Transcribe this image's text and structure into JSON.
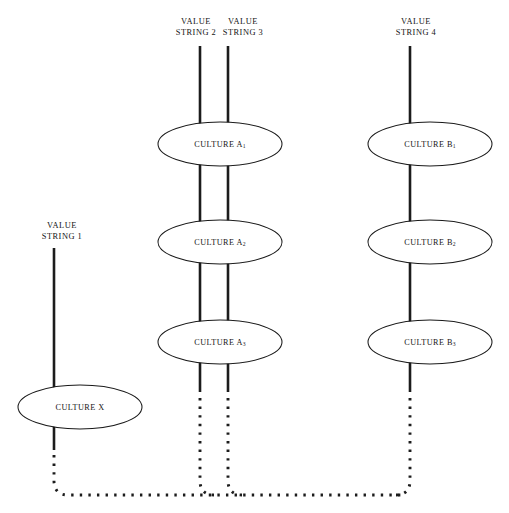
{
  "diagram": {
    "colors": {
      "background": "#ffffff",
      "stroke": "#1c1c1c",
      "ellipse_stroke": "#1a1a1a",
      "text": "#141414"
    },
    "value_strings": [
      {
        "id": "vs1",
        "line1": "VALUE",
        "line2": "STRING 1",
        "x": 62,
        "label_y": 228
      },
      {
        "id": "vs2",
        "line1": "VALUE",
        "line2": "STRING 2",
        "x": 196,
        "label_y": 24
      },
      {
        "id": "vs3",
        "line1": "VALUE",
        "line2": "STRING 3",
        "x": 243,
        "label_y": 24
      },
      {
        "id": "vs4",
        "line1": "VALUE",
        "line2": "STRING 4",
        "x": 416,
        "label_y": 24
      }
    ],
    "cultures": [
      {
        "id": "culture-a1",
        "name": "CULTURE A",
        "subscript": "1",
        "cx": 220,
        "cy": 144,
        "rx": 62,
        "ry": 22
      },
      {
        "id": "culture-a2",
        "name": "CULTURE A",
        "subscript": "2",
        "cx": 220,
        "cy": 242,
        "rx": 62,
        "ry": 22
      },
      {
        "id": "culture-a3",
        "name": "CULTURE A",
        "subscript": "3",
        "cx": 220,
        "cy": 342,
        "rx": 62,
        "ry": 22
      },
      {
        "id": "culture-b1",
        "name": "CULTURE B",
        "subscript": "1",
        "cx": 430,
        "cy": 144,
        "rx": 62,
        "ry": 22
      },
      {
        "id": "culture-b2",
        "name": "CULTURE B",
        "subscript": "2",
        "cx": 430,
        "cy": 242,
        "rx": 62,
        "ry": 22
      },
      {
        "id": "culture-b3",
        "name": "CULTURE B",
        "subscript": "3",
        "cx": 430,
        "cy": 342,
        "rx": 62,
        "ry": 22
      },
      {
        "id": "culture-x",
        "name": "CULTURE X",
        "subscript": "",
        "cx": 80,
        "cy": 407,
        "rx": 62,
        "ry": 22
      }
    ],
    "solid_segments": [
      {
        "id": "seg-vs2-top",
        "x1": 200,
        "y1": 46,
        "x2": 200,
        "y2": 128
      },
      {
        "id": "seg-vs3-top",
        "x1": 228,
        "y1": 46,
        "x2": 228,
        "y2": 128
      },
      {
        "id": "seg-vs2-a1a2",
        "x1": 200,
        "y1": 160,
        "x2": 200,
        "y2": 226
      },
      {
        "id": "seg-vs3-a1a2",
        "x1": 228,
        "y1": 160,
        "x2": 228,
        "y2": 226
      },
      {
        "id": "seg-vs2-a2a3",
        "x1": 200,
        "y1": 258,
        "x2": 200,
        "y2": 326
      },
      {
        "id": "seg-vs3-a2a3",
        "x1": 228,
        "y1": 258,
        "x2": 228,
        "y2": 326
      },
      {
        "id": "seg-vs2-a3out",
        "x1": 200,
        "y1": 358,
        "x2": 200,
        "y2": 392
      },
      {
        "id": "seg-vs3-a3out",
        "x1": 228,
        "y1": 358,
        "x2": 228,
        "y2": 392
      },
      {
        "id": "seg-vs4-top",
        "x1": 410,
        "y1": 46,
        "x2": 410,
        "y2": 128
      },
      {
        "id": "seg-vs4-b1b2",
        "x1": 410,
        "y1": 160,
        "x2": 410,
        "y2": 226
      },
      {
        "id": "seg-vs4-b2b3",
        "x1": 410,
        "y1": 258,
        "x2": 410,
        "y2": 326
      },
      {
        "id": "seg-vs4-b3out",
        "x1": 410,
        "y1": 358,
        "x2": 410,
        "y2": 392
      },
      {
        "id": "seg-vs1-top",
        "x1": 54,
        "y1": 248,
        "x2": 54,
        "y2": 391
      },
      {
        "id": "seg-vs1-xout",
        "x1": 54,
        "y1": 423,
        "x2": 54,
        "y2": 450
      }
    ],
    "dotted_paths": [
      {
        "id": "dot-path-x",
        "d": "M 54 455 L 54 482 Q 55 495 68 495 L 404 495"
      },
      {
        "id": "dot-path-vs2",
        "d": "M 200 398 L 200 482 Q 201 495 214 495"
      },
      {
        "id": "dot-path-vs3",
        "d": "M 228 398 L 228 482 Q 229 495 242 495"
      },
      {
        "id": "dot-path-vs4",
        "d": "M 410 398 L 410 482 Q 409 495 396 495"
      }
    ]
  }
}
